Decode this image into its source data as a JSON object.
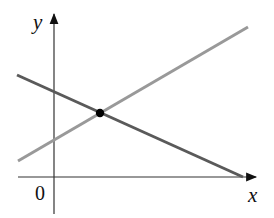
{
  "diagram": {
    "type": "coordinate-plane-two-lines",
    "labels": {
      "y_axis": "y",
      "x_axis": "x",
      "origin": "0"
    },
    "colors": {
      "axis": "#222222",
      "line_decreasing": "#5a5a5a",
      "line_increasing": "#999999",
      "intersection_point": "#000000"
    },
    "axes": {
      "origin_px": [
        54,
        177
      ],
      "x_axis": {
        "from": [
          18,
          177
        ],
        "to": [
          256,
          177
        ]
      },
      "y_axis": {
        "from": [
          54,
          214
        ],
        "to": [
          54,
          14
        ]
      }
    },
    "lines": [
      {
        "name": "decreasing line",
        "from": [
          17,
          75
        ],
        "to": [
          243,
          177
        ]
      },
      {
        "name": "increasing line",
        "from": [
          18,
          161
        ],
        "to": [
          248,
          27
        ]
      }
    ],
    "intersection": {
      "px": [
        100,
        113
      ],
      "radius": 4
    }
  }
}
